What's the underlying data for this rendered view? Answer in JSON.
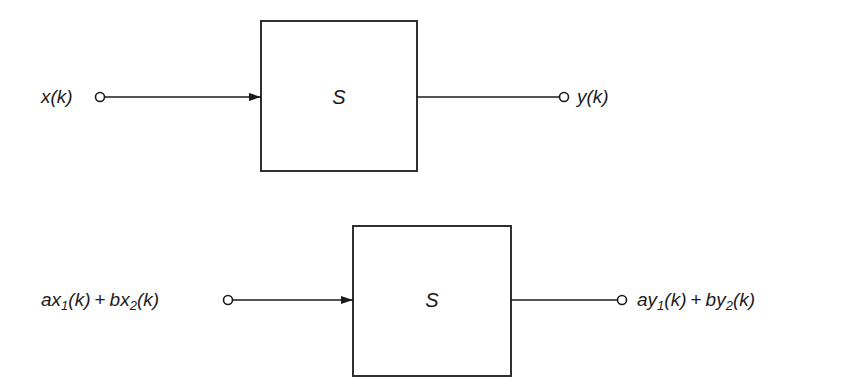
{
  "diagram": {
    "type": "block-diagram",
    "stroke_color": "#1a1a1a",
    "background": "#ffffff",
    "top": {
      "system_label": "S",
      "input": {
        "var": "x",
        "arg": "(k)"
      },
      "output": {
        "var": "y",
        "arg": "(k)"
      },
      "box": {
        "x": 261,
        "y": 21,
        "width": 156,
        "height": 150
      },
      "signal_y": 97,
      "input_node_x": 100,
      "output_node_x": 564
    },
    "bottom": {
      "system_label": "S",
      "input": {
        "coef1": "a",
        "var1": "x",
        "sub1": "1",
        "arg1": "(k)",
        "plus": "+",
        "coef2": "b",
        "var2": "x",
        "sub2": "2",
        "arg2": "(k)"
      },
      "output": {
        "coef1": "a",
        "var1": "y",
        "sub1": "1",
        "arg1": "(k)",
        "plus": "+",
        "coef2": "b",
        "var2": "y",
        "sub2": "2",
        "arg2": "(k)"
      },
      "box": {
        "x": 353,
        "y": 226,
        "width": 158,
        "height": 150
      },
      "signal_y": 300,
      "input_node_x": 228,
      "output_node_x": 622
    }
  }
}
